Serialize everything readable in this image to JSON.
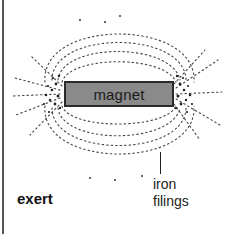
{
  "diagram": {
    "magnet_label": "magnet",
    "filings_label_line1": "iron",
    "filings_label_line2": "filings",
    "caption_word": "exert",
    "colors": {
      "magnet_fill": "#8a8a8a",
      "magnet_border": "#2a2a2a",
      "filings": "#333333",
      "background": "#ffffff"
    }
  }
}
